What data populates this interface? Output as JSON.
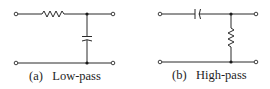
{
  "figure": {
    "panels": [
      {
        "id": "a",
        "caption_tag": "(a)",
        "caption_text": "Low-pass",
        "series_element": "resistor",
        "shunt_element": "capacitor",
        "terminals": 4
      },
      {
        "id": "b",
        "caption_tag": "(b)",
        "caption_text": "High-pass",
        "series_element": "capacitor",
        "shunt_element": "resistor",
        "terminals": 4
      }
    ],
    "colors": {
      "ink": "#2a2a2a",
      "background": "#ffffff"
    }
  }
}
